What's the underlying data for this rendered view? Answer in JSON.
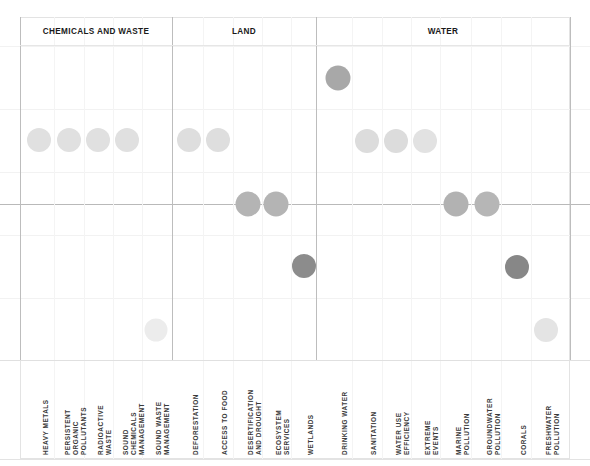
{
  "chart_data": {
    "type": "scatter",
    "title": "",
    "xlabel": "",
    "ylabel": "",
    "grid": true,
    "legend_position": "none",
    "groups": [
      {
        "name": "CHEMICALS AND WASTE",
        "start_x": 20,
        "end_x": 172
      },
      {
        "name": "LAND",
        "start_x": 172,
        "end_x": 316
      },
      {
        "name": "WATER",
        "start_x": 316,
        "end_x": 570
      }
    ],
    "categories": [
      "HEAVY METALS",
      "PERSISTENT ORGANIC POLLUTANTS",
      "RADIOACTIVE WASTE",
      "SOUND CHEMICALS MANAGEMENT",
      "SOUND WASTE MANAGEMENT",
      "DEFORESTATION",
      "ACCESS TO FOOD",
      "DESERTIFICATION AND DROUGHT",
      "ECOSYSTEM SERVICES",
      "WETLANDS",
      "DRINKING WATER",
      "SANITATION",
      "WATER USE EFFICIENCY",
      "EXTREME EVENTS",
      "MARINE POLLUTION",
      "GROUNDWATER POLLUTION",
      "CORALS",
      "FRESHWATER POLLUTION"
    ],
    "points": [
      {
        "category": "HEAVY METALS",
        "group": "CHEMICALS AND WASTE",
        "x": 39,
        "y": 140,
        "level": 2,
        "color": "#e0e0e0",
        "size": 24
      },
      {
        "category": "PERSISTENT ORGANIC POLLUTANTS",
        "group": "CHEMICALS AND WASTE",
        "x": 69,
        "y": 140,
        "level": 2,
        "color": "#e0e0e0",
        "size": 24
      },
      {
        "category": "RADIOACTIVE WASTE",
        "group": "CHEMICALS AND WASTE",
        "x": 98,
        "y": 140,
        "level": 2,
        "color": "#e0e0e0",
        "size": 24
      },
      {
        "category": "SOUND CHEMICALS MANAGEMENT",
        "group": "CHEMICALS AND WASTE",
        "x": 127,
        "y": 140,
        "level": 2,
        "color": "#e0e0e0",
        "size": 24
      },
      {
        "category": "SOUND WASTE MANAGEMENT",
        "group": "CHEMICALS AND WASTE",
        "x": 156,
        "y": 330,
        "level": 5,
        "color": "#ececec",
        "size": 23
      },
      {
        "category": "DEFORESTATION",
        "group": "LAND",
        "x": 189,
        "y": 140,
        "level": 2,
        "color": "#dedede",
        "size": 24
      },
      {
        "category": "ACCESS TO FOOD",
        "group": "LAND",
        "x": 218,
        "y": 140,
        "level": 2,
        "color": "#dedede",
        "size": 24
      },
      {
        "category": "DESERTIFICATION AND DROUGHT",
        "group": "LAND",
        "x": 248,
        "y": 204,
        "level": 3,
        "color": "#b4b4b4",
        "size": 25
      },
      {
        "category": "ECOSYSTEM SERVICES",
        "group": "LAND",
        "x": 276,
        "y": 204,
        "level": 3,
        "color": "#b4b4b4",
        "size": 25
      },
      {
        "category": "WETLANDS",
        "group": "LAND",
        "x": 304,
        "y": 266,
        "level": 4,
        "color": "#8c8c8c",
        "size": 24
      },
      {
        "category": "DRINKING WATER",
        "group": "WATER",
        "x": 338,
        "y": 78,
        "level": 1,
        "color": "#a8a8a8",
        "size": 25
      },
      {
        "category": "SANITATION",
        "group": "WATER",
        "x": 367,
        "y": 141,
        "level": 2,
        "color": "#dcdcdc",
        "size": 24
      },
      {
        "category": "WATER USE EFFICIENCY",
        "group": "WATER",
        "x": 396,
        "y": 141,
        "level": 2,
        "color": "#dcdcdc",
        "size": 24
      },
      {
        "category": "EXTREME EVENTS",
        "group": "WATER",
        "x": 425,
        "y": 141,
        "level": 2,
        "color": "#e2e2e2",
        "size": 24
      },
      {
        "category": "MARINE POLLUTION",
        "group": "WATER",
        "x": 456,
        "y": 204,
        "level": 3,
        "color": "#b2b2b2",
        "size": 25
      },
      {
        "category": "GROUNDWATER POLLUTION",
        "group": "WATER",
        "x": 487,
        "y": 204,
        "level": 3,
        "color": "#b6b6b6",
        "size": 25
      },
      {
        "category": "CORALS",
        "group": "WATER",
        "x": 517,
        "y": 267,
        "level": 4,
        "color": "#878787",
        "size": 24
      },
      {
        "category": "FRESHWATER POLLUTION",
        "group": "WATER",
        "x": 546,
        "y": 330,
        "level": 5,
        "color": "#e4e4e4",
        "size": 24
      }
    ],
    "hgridlines": [
      {
        "y": 46,
        "strong": false
      },
      {
        "y": 109,
        "strong": false
      },
      {
        "y": 172,
        "strong": false
      },
      {
        "y": 204,
        "strong": true
      },
      {
        "y": 235,
        "strong": false
      },
      {
        "y": 298,
        "strong": false
      },
      {
        "y": 360,
        "strong": false
      }
    ],
    "vgridlines": [
      54,
      84,
      113,
      142,
      203,
      233,
      262,
      291,
      352,
      382,
      411,
      440,
      471,
      501,
      531
    ],
    "section_dividers": [
      20,
      172,
      316,
      570
    ],
    "axis_y": 204
  }
}
